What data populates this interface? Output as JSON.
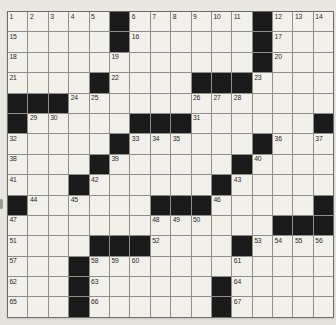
{
  "puzzle": {
    "kind": "crossword-grid",
    "rows": 15,
    "cols": 16,
    "colors": {
      "paper": "#e9e7e2",
      "cell_fill": "#f2f0eb",
      "black_square": "#1b1b1b",
      "grid_line": "#908e8a",
      "outer_border": "#6e6c68",
      "number_text": "#2c2b29"
    },
    "black_cells": [
      [
        1,
        6
      ],
      [
        1,
        13
      ],
      [
        2,
        6
      ],
      [
        2,
        13
      ],
      [
        3,
        13
      ],
      [
        4,
        5
      ],
      [
        4,
        10
      ],
      [
        4,
        11
      ],
      [
        4,
        12
      ],
      [
        5,
        1
      ],
      [
        5,
        2
      ],
      [
        5,
        3
      ],
      [
        6,
        1
      ],
      [
        6,
        7
      ],
      [
        6,
        8
      ],
      [
        6,
        9
      ],
      [
        6,
        16
      ],
      [
        7,
        6
      ],
      [
        7,
        13
      ],
      [
        8,
        5
      ],
      [
        8,
        12
      ],
      [
        9,
        4
      ],
      [
        9,
        11
      ],
      [
        10,
        1
      ],
      [
        10,
        8
      ],
      [
        10,
        9
      ],
      [
        10,
        10
      ],
      [
        10,
        16
      ],
      [
        11,
        14
      ],
      [
        11,
        15
      ],
      [
        11,
        16
      ],
      [
        12,
        5
      ],
      [
        12,
        6
      ],
      [
        12,
        7
      ],
      [
        12,
        12
      ],
      [
        13,
        4
      ],
      [
        14,
        4
      ],
      [
        14,
        11
      ],
      [
        15,
        4
      ],
      [
        15,
        11
      ]
    ],
    "numbers": [
      {
        "n": "1",
        "r": 1,
        "c": 1
      },
      {
        "n": "2",
        "r": 1,
        "c": 2
      },
      {
        "n": "3",
        "r": 1,
        "c": 3
      },
      {
        "n": "4",
        "r": 1,
        "c": 4
      },
      {
        "n": "5",
        "r": 1,
        "c": 5
      },
      {
        "n": "6",
        "r": 1,
        "c": 7
      },
      {
        "n": "7",
        "r": 1,
        "c": 8
      },
      {
        "n": "8",
        "r": 1,
        "c": 9
      },
      {
        "n": "9",
        "r": 1,
        "c": 10
      },
      {
        "n": "10",
        "r": 1,
        "c": 11
      },
      {
        "n": "11",
        "r": 1,
        "c": 12
      },
      {
        "n": "12",
        "r": 1,
        "c": 14
      },
      {
        "n": "13",
        "r": 1,
        "c": 15
      },
      {
        "n": "14",
        "r": 1,
        "c": 16
      },
      {
        "n": "15",
        "r": 2,
        "c": 1
      },
      {
        "n": "16",
        "r": 2,
        "c": 7
      },
      {
        "n": "17",
        "r": 2,
        "c": 14
      },
      {
        "n": "18",
        "r": 3,
        "c": 1
      },
      {
        "n": "19",
        "r": 3,
        "c": 6
      },
      {
        "n": "20",
        "r": 3,
        "c": 14
      },
      {
        "n": "21",
        "r": 4,
        "c": 1
      },
      {
        "n": "22",
        "r": 4,
        "c": 6
      },
      {
        "n": "23",
        "r": 4,
        "c": 13
      },
      {
        "n": "24",
        "r": 5,
        "c": 4
      },
      {
        "n": "25",
        "r": 5,
        "c": 5
      },
      {
        "n": "26",
        "r": 5,
        "c": 10
      },
      {
        "n": "27",
        "r": 5,
        "c": 11
      },
      {
        "n": "28",
        "r": 5,
        "c": 12
      },
      {
        "n": "29",
        "r": 6,
        "c": 2
      },
      {
        "n": "30",
        "r": 6,
        "c": 3
      },
      {
        "n": "31",
        "r": 6,
        "c": 10
      },
      {
        "n": "32",
        "r": 7,
        "c": 1
      },
      {
        "n": "33",
        "r": 7,
        "c": 7
      },
      {
        "n": "34",
        "r": 7,
        "c": 8
      },
      {
        "n": "35",
        "r": 7,
        "c": 9
      },
      {
        "n": "36",
        "r": 7,
        "c": 14
      },
      {
        "n": "37",
        "r": 7,
        "c": 16
      },
      {
        "n": "38",
        "r": 8,
        "c": 1
      },
      {
        "n": "39",
        "r": 8,
        "c": 6
      },
      {
        "n": "40",
        "r": 8,
        "c": 13
      },
      {
        "n": "41",
        "r": 9,
        "c": 1
      },
      {
        "n": "42",
        "r": 9,
        "c": 5
      },
      {
        "n": "43",
        "r": 9,
        "c": 12
      },
      {
        "n": "44",
        "r": 10,
        "c": 2
      },
      {
        "n": "45",
        "r": 10,
        "c": 4
      },
      {
        "n": "46",
        "r": 10,
        "c": 11
      },
      {
        "n": "47",
        "r": 11,
        "c": 1
      },
      {
        "n": "48",
        "r": 11,
        "c": 8
      },
      {
        "n": "49",
        "r": 11,
        "c": 9
      },
      {
        "n": "50",
        "r": 11,
        "c": 10
      },
      {
        "n": "51",
        "r": 12,
        "c": 1
      },
      {
        "n": "52",
        "r": 12,
        "c": 8
      },
      {
        "n": "53",
        "r": 12,
        "c": 13
      },
      {
        "n": "54",
        "r": 12,
        "c": 14
      },
      {
        "n": "55",
        "r": 12,
        "c": 15
      },
      {
        "n": "56",
        "r": 12,
        "c": 16
      },
      {
        "n": "57",
        "r": 13,
        "c": 1
      },
      {
        "n": "58",
        "r": 13,
        "c": 5
      },
      {
        "n": "59",
        "r": 13,
        "c": 6
      },
      {
        "n": "60",
        "r": 13,
        "c": 7
      },
      {
        "n": "61",
        "r": 13,
        "c": 12
      },
      {
        "n": "62",
        "r": 14,
        "c": 1
      },
      {
        "n": "63",
        "r": 14,
        "c": 5
      },
      {
        "n": "64",
        "r": 14,
        "c": 12
      },
      {
        "n": "65",
        "r": 15,
        "c": 1
      },
      {
        "n": "66",
        "r": 15,
        "c": 5
      },
      {
        "n": "67",
        "r": 15,
        "c": 12
      }
    ]
  }
}
